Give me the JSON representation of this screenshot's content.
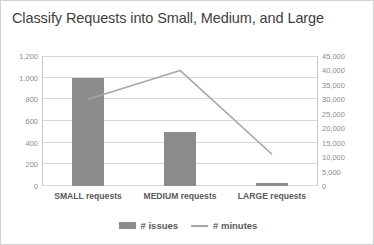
{
  "chart_data": {
    "type": "bar",
    "title": "Classify Requests into Small, Medium, and Large",
    "categories": [
      "SMALL requests",
      "MEDIUM requests",
      "LARGE requests"
    ],
    "series": [
      {
        "name": "# issues",
        "type": "bar",
        "axis": "left",
        "color": "#8c8c8c",
        "values": [
          1000,
          500,
          25
        ]
      },
      {
        "name": "# minutes",
        "type": "line",
        "axis": "right",
        "color": "#a6a6a6",
        "values": [
          30000,
          40000,
          11000
        ]
      }
    ],
    "xlabel": "",
    "ylabel": "",
    "y_left": {
      "min": 0,
      "max": 1200,
      "step": 200,
      "ticks": [
        "0",
        "200",
        "400",
        "600",
        "800",
        "1,000",
        "1,200"
      ]
    },
    "y_right": {
      "min": 0,
      "max": 45000,
      "step": 5000,
      "ticks": [
        "0",
        "5,000",
        "10,000",
        "15,000",
        "20,000",
        "25,000",
        "30,000",
        "35,000",
        "40,000",
        "45,000"
      ]
    },
    "grid": true,
    "legend": {
      "position": "bottom",
      "entries": [
        {
          "label": "# issues",
          "marker": "bar-swatch"
        },
        {
          "label": "# minutes",
          "marker": "line-swatch"
        }
      ]
    }
  }
}
